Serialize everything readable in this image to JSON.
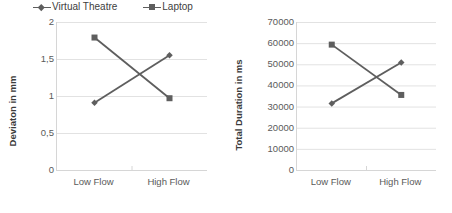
{
  "legend": {
    "items": [
      {
        "label": "Virtual Theatre",
        "marker": "diamond-marker-icon",
        "color": "#5e5e5e"
      },
      {
        "label": "Laptop",
        "marker": "square-marker-icon",
        "color": "#5e5e5e"
      }
    ]
  },
  "chart_data": [
    {
      "type": "line",
      "title": "",
      "xlabel": "",
      "ylabel": "Deviaton in mm",
      "categories": [
        "Low Flow",
        "High Flow"
      ],
      "series": [
        {
          "name": "Virtual Theatre",
          "values": [
            0.91,
            1.55
          ],
          "marker": "diamond",
          "color": "#5e5e5e"
        },
        {
          "name": "Laptop",
          "values": [
            1.79,
            0.97
          ],
          "marker": "square",
          "color": "#5e5e5e"
        }
      ],
      "ylim": [
        0,
        2
      ],
      "yticks": [
        2,
        1.5,
        1,
        0.5,
        0
      ],
      "ytick_labels": [
        "2",
        "1,5",
        "1",
        "0,5",
        "0"
      ],
      "grid": true,
      "legend_position": "top"
    },
    {
      "type": "line",
      "title": "",
      "xlabel": "",
      "ylabel": "Total Duration in ms",
      "categories": [
        "Low Flow",
        "High Flow"
      ],
      "series": [
        {
          "name": "Virtual Theatre",
          "values": [
            31500,
            50800
          ],
          "marker": "diamond",
          "color": "#5e5e5e"
        },
        {
          "name": "Laptop",
          "values": [
            59300,
            35500
          ],
          "marker": "square",
          "color": "#5e5e5e"
        }
      ],
      "ylim": [
        0,
        70000
      ],
      "yticks": [
        70000,
        60000,
        50000,
        40000,
        30000,
        20000,
        10000,
        0
      ],
      "ytick_labels": [
        "70000",
        "60000",
        "50000",
        "40000",
        "30000",
        "20000",
        "10000",
        "0"
      ],
      "grid": true,
      "legend_position": "none"
    }
  ],
  "style": {
    "line_color": "#5e5e5e",
    "grid_color": "#e2e2e2",
    "axis_color": "#d6d6d6",
    "text_color": "#5a5a5a",
    "background": "#ffffff"
  }
}
